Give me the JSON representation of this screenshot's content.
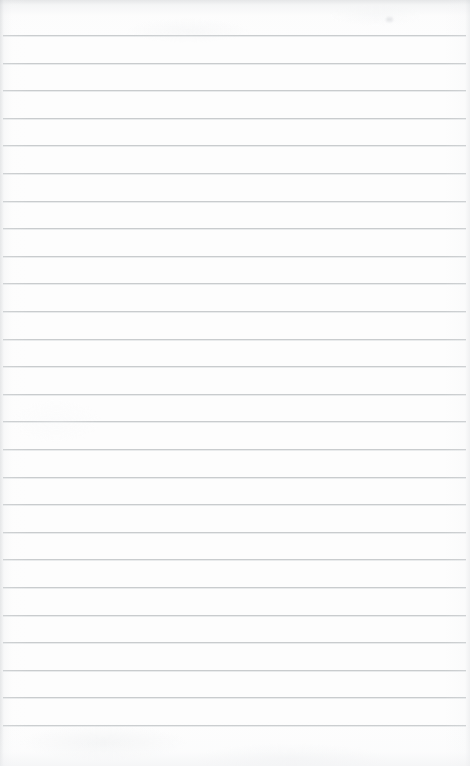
{
  "document": {
    "kind": "scanned-lined-paper",
    "title": "Blank Ruled Notebook Page",
    "width": 470,
    "height": 766,
    "content_text": "",
    "handwriting_present": "no",
    "printed_text_present": "no"
  },
  "colors": {
    "paper_background": "#fdfdfd",
    "rule_line": "#c9ccce",
    "rule_line_highlight": "#e2e4e6",
    "edge_shadow": "#cdcfd2",
    "speck": "#d3d5d8"
  },
  "ruling": {
    "style": "horizontal-ruled",
    "line_count": 26,
    "first_line_y": 35,
    "line_spacing": 27.6,
    "line_thickness": 1,
    "line_start_x": 3,
    "line_end_x": 466,
    "margin_line_present": "no",
    "lines_y": [
      35,
      62.6,
      90.2,
      117.8,
      145.4,
      173,
      200.6,
      228.2,
      255.8,
      283.4,
      311,
      338.6,
      366.2,
      393.8,
      421.4,
      449,
      476.6,
      504.2,
      531.8,
      559.4,
      587,
      614.6,
      642.2,
      669.8,
      697.4,
      725
    ]
  },
  "margins": {
    "top_blank_height": 35,
    "bottom_blank_height": 41,
    "left_blank_width": 3,
    "right_blank_width": 4
  },
  "artifacts": [
    {
      "name": "top-edge-shadow",
      "position": "top"
    },
    {
      "name": "left-edge-shadow",
      "position": "left"
    },
    {
      "name": "right-edge-shadow",
      "position": "right"
    },
    {
      "name": "bottom-edge-shade",
      "position": "bottom"
    },
    {
      "name": "smudge-speck",
      "x": 386,
      "y": 17
    }
  ]
}
